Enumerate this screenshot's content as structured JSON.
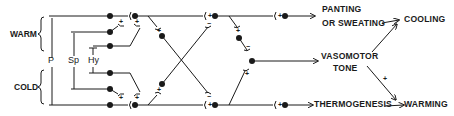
{
  "diagram": {
    "inputs": [
      {
        "id": "warm",
        "label": "WARM"
      },
      {
        "id": "cold",
        "label": "COLD"
      }
    ],
    "receptor_groups": [
      {
        "id": "p",
        "label": "P"
      },
      {
        "id": "sp",
        "label": "Sp"
      },
      {
        "id": "hy",
        "label": "Hy"
      }
    ],
    "effectors": [
      {
        "id": "panting",
        "line1": "PANTING",
        "line2": "OR SWEATING"
      },
      {
        "id": "vasomotor",
        "line1": "VASOMOTOR",
        "line2": "TONE"
      },
      {
        "id": "thermogenesis",
        "label": "THERMOGENESIS"
      }
    ],
    "outcomes": [
      {
        "id": "cooling",
        "label": "COOLING"
      },
      {
        "id": "warming",
        "label": "WARMING"
      }
    ],
    "signs": {
      "plus": "+",
      "minus": "−"
    },
    "vasomotor_to_warming_sign": "+",
    "colors": {
      "ink": "#1a1a1a",
      "background": "#ffffff"
    }
  }
}
